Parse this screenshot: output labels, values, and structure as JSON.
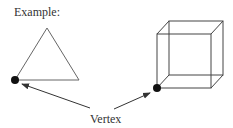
{
  "diagram": {
    "heading": "Example:",
    "label": "Vertex",
    "shapes": [
      {
        "name": "triangle",
        "type": "2d-polygon",
        "marked_vertex": "bottom-left"
      },
      {
        "name": "cube",
        "type": "3d-wireframe",
        "marked_vertex": "front-bottom-left"
      }
    ],
    "colors": {
      "stroke": "#555555",
      "vertex_dot": "#111111",
      "text": "#333333"
    }
  }
}
